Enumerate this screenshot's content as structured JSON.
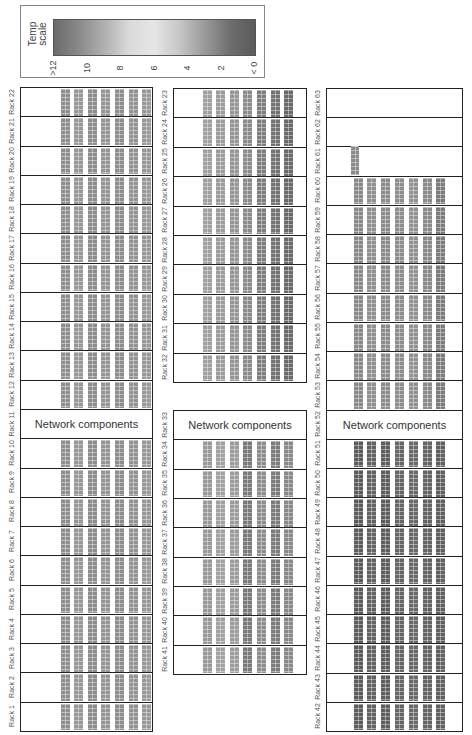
{
  "legend": {
    "title_line1": "Temp",
    "title_line2": "scale",
    "ticks": [
      ">12",
      "10",
      "8",
      "6",
      "4",
      "2",
      "< 0"
    ],
    "gradient_colors": [
      "#6b6b6b",
      "#8a8a8a",
      "#b0b0b0",
      "#dadada",
      "#e6e6e6",
      "#c6c6c6",
      "#9a9a9a",
      "#6e6e6e",
      "#5a5a5a"
    ]
  },
  "network_label": "Network components",
  "groups": [
    {
      "id": "left",
      "racks": [
        "Rack 22",
        "Rack 21",
        "Rack 20",
        "Rack 19",
        "Rack 18",
        "Rack 17",
        "Rack 16",
        "Rack 15",
        "Rack 14",
        "Rack 13",
        "Rack 12",
        "Rack 11",
        "Rack 10",
        "Rack 9",
        "Rack 8",
        "Rack 7",
        "Rack 6",
        "Rack 5",
        "Rack 4",
        "Rack 3",
        "Rack 2",
        "Rack 1"
      ],
      "network_rack": "Rack 11",
      "shades": [
        "#8f8f8f",
        "#989898",
        "#8c8c8c",
        "#969696",
        "#8e8e8e",
        "#939393",
        "#999999"
      ]
    },
    {
      "id": "middle-top",
      "racks": [
        "Rack 23",
        "Rack 24",
        "Rack 25",
        "Rack 26",
        "Rack 27",
        "Rack 28",
        "Rack 29",
        "Rack 30",
        "Rack 31",
        "Rack 32"
      ],
      "shades": [
        "#a0a0a0",
        "#9c9c9c",
        "#969696",
        "#8c8c8c",
        "#7e7e7e",
        "#727272",
        "#6a6a6a"
      ]
    },
    {
      "id": "middle-bottom",
      "racks": [
        "Rack 33",
        "Rack 34",
        "Rack 35",
        "Rack 36",
        "Rack 37",
        "Rack 38",
        "Rack 39",
        "Rack 40",
        "Rack 41"
      ],
      "network_rack": "Rack 33",
      "shades": [
        "#9a9a9a",
        "#a2a2a2",
        "#9c9c9c",
        "#7a7a7a",
        "#8e8e8e",
        "#7c7c7c",
        "#8a8a8a"
      ]
    },
    {
      "id": "right",
      "racks": [
        "Rack 63",
        "Rack 62",
        "Rack 61",
        "Rack 60",
        "Rack 59",
        "Rack 58",
        "Rack 57",
        "Rack 56",
        "Rack 55",
        "Rack 54",
        "Rack 53",
        "Rack 52",
        "Rack 51",
        "Rack 50",
        "Rack 49",
        "Rack 48",
        "Rack 47",
        "Rack 46",
        "Rack 45",
        "Rack 44",
        "Rack 43",
        "Rack 42"
      ],
      "network_rack": "Rack 52",
      "empty_racks": [
        "Rack 63",
        "Rack 62"
      ],
      "partial_rack": "Rack 61",
      "shades_upper": [
        "#8a8a8a",
        "#909090",
        "#8c8c8c",
        "#8e8e8e",
        "#929292",
        "#8a8a8a",
        "#7c7c7c"
      ],
      "shades_lower": [
        "#5c5c5c",
        "#626262",
        "#5e5e5e",
        "#666666",
        "#6a6a6a",
        "#646464",
        "#606060"
      ]
    }
  ]
}
